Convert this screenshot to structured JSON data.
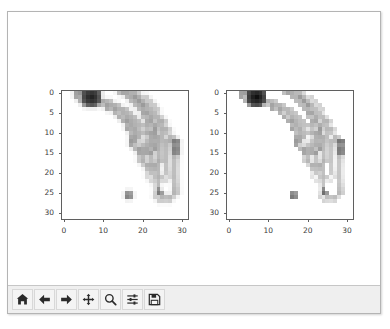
{
  "window": {
    "type": "matplotlib-figure-window",
    "background_color": "#ffffff",
    "frame_color": "#b4b4b4"
  },
  "toolbar": {
    "background_color": "#efefef",
    "buttons": [
      {
        "name": "home-icon",
        "label": "Home",
        "tooltip": "Reset original view"
      },
      {
        "name": "arrow-left-icon",
        "label": "Back",
        "tooltip": "Back to previous view"
      },
      {
        "name": "arrow-right-icon",
        "label": "Forward",
        "tooltip": "Forward to next view"
      },
      {
        "name": "move-icon",
        "label": "Pan",
        "tooltip": "Pan axes with left mouse, zoom with right"
      },
      {
        "name": "magnifier-icon",
        "label": "Zoom",
        "tooltip": "Zoom to rectangle"
      },
      {
        "name": "sliders-icon",
        "label": "Subplots",
        "tooltip": "Configure subplots"
      },
      {
        "name": "floppy-disk-icon",
        "label": "Save",
        "tooltip": "Save the figure"
      }
    ]
  },
  "caption": "",
  "chart_data": [
    {
      "id": "left",
      "type": "heatmap",
      "title": "",
      "xlabel": "",
      "ylabel": "",
      "colormap": "gray",
      "grid": false,
      "legend": "none",
      "xlim": [
        -0.5,
        31.5
      ],
      "ylim": [
        31.5,
        -0.5
      ],
      "xticks": [
        0,
        10,
        20,
        30
      ],
      "xtick_labels": [
        "0",
        "10",
        "20",
        "30"
      ],
      "yticks": [
        0,
        5,
        10,
        15,
        20,
        25,
        30
      ],
      "ytick_labels": [
        "0",
        "5",
        "10",
        "15",
        "20",
        "25",
        "30"
      ],
      "image_shape": [
        32,
        32
      ],
      "value_range": [
        0,
        255
      ],
      "description": "32x32 downsampled grayscale photograph of a bunch of bananas on a white background"
    },
    {
      "id": "right",
      "type": "heatmap",
      "title": "",
      "xlabel": "",
      "ylabel": "",
      "colormap": "gray",
      "grid": false,
      "legend": "none",
      "xlim": [
        -0.5,
        31.5
      ],
      "ylim": [
        31.5,
        -0.5
      ],
      "xticks": [
        0,
        10,
        20,
        30
      ],
      "xtick_labels": [
        "0",
        "10",
        "20",
        "30"
      ],
      "yticks": [
        0,
        5,
        10,
        15,
        20,
        25,
        30
      ],
      "ytick_labels": [
        "0",
        "5",
        "10",
        "15",
        "20",
        "25",
        "30"
      ],
      "image_shape": [
        32,
        32
      ],
      "value_range": [
        0,
        255
      ],
      "description": "32x32 downsampled grayscale photograph of a bunch of bananas, slightly sharper/contrast-enhanced version of the left image"
    }
  ]
}
